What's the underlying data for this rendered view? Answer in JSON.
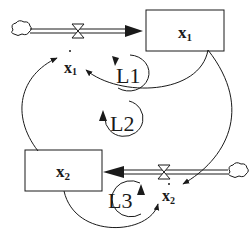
{
  "diagram": {
    "type": "stock-and-flow",
    "stocks": [
      {
        "id": "stock-x1",
        "label": "x",
        "subscript": "1"
      },
      {
        "id": "stock-x2",
        "label": "x",
        "subscript": "2"
      }
    ],
    "flows": [
      {
        "id": "flow-x1",
        "label": "x",
        "subscript": "1",
        "dot": "·"
      },
      {
        "id": "flow-x2",
        "label": "x",
        "subscript": "2",
        "dot": "·"
      }
    ],
    "loops": [
      {
        "id": "loop-1",
        "label": "L1"
      },
      {
        "id": "loop-2",
        "label": "L2"
      },
      {
        "id": "loop-3",
        "label": "L3"
      }
    ],
    "colors": {
      "line": "#1a1a1a",
      "background": "#ffffff"
    }
  }
}
